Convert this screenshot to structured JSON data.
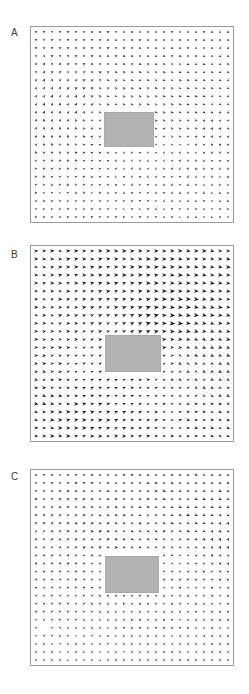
{
  "figure": {
    "width": 249,
    "height": 694,
    "background": "#ffffff",
    "arrow_color": "#101010",
    "obstacle_color": "#b2b2b2",
    "border_color": "#9a9a9a",
    "label_color": "#3a3a3a"
  },
  "panels": [
    {
      "label": "A",
      "label_x": 11,
      "label_y": 28,
      "frame": {
        "x": 30,
        "y": 26,
        "w": 204,
        "h": 197
      },
      "obstacle": {
        "x": 103,
        "y": 111,
        "w": 50,
        "h": 35
      },
      "grid": {
        "cols": 25,
        "rows": 24,
        "pad": 5
      },
      "field": {
        "type": "vortex",
        "centers": [
          {
            "cx": 0.3,
            "cy": 0.45,
            "strength": 1.0,
            "sense": 1
          },
          {
            "cx": 0.78,
            "cy": 0.58,
            "strength": 0.72,
            "sense": 1
          }
        ],
        "uniform": {
          "u": 0.04,
          "v": -0.02
        },
        "scale": 6.2,
        "seed": 17
      }
    },
    {
      "label": "B",
      "label_x": 11,
      "label_y": 250,
      "frame": {
        "x": 30,
        "y": 245,
        "w": 204,
        "h": 197
      },
      "obstacle": {
        "x": 104,
        "y": 334,
        "w": 56,
        "h": 37
      },
      "grid": {
        "cols": 25,
        "rows": 24,
        "pad": 5
      },
      "field": {
        "type": "vortex",
        "centers": [
          {
            "cx": 0.68,
            "cy": 0.5,
            "strength": 1.05,
            "sense": 1
          },
          {
            "cx": 0.22,
            "cy": 0.74,
            "strength": 0.55,
            "sense": -1
          }
        ],
        "uniform": {
          "u": 0.3,
          "v": 0.02
        },
        "scale": 6.4,
        "seed": 41
      }
    },
    {
      "label": "C",
      "label_x": 11,
      "label_y": 472,
      "frame": {
        "x": 30,
        "y": 469,
        "w": 204,
        "h": 197
      },
      "obstacle": {
        "x": 104,
        "y": 555,
        "w": 54,
        "h": 37
      },
      "grid": {
        "cols": 25,
        "rows": 24,
        "pad": 5
      },
      "field": {
        "type": "vortex",
        "centers": [
          {
            "cx": 0.34,
            "cy": 0.52,
            "strength": 1.0,
            "sense": 1
          },
          {
            "cx": 0.8,
            "cy": 0.38,
            "strength": 0.68,
            "sense": 1
          }
        ],
        "uniform": {
          "u": 0.08,
          "v": 0.03
        },
        "scale": 6.2,
        "seed": 93
      }
    }
  ],
  "chart_data": {
    "type": "quiver",
    "title": "",
    "xlabel": "",
    "ylabel": "",
    "grid": false,
    "legend": null,
    "panel_count": 3,
    "panel_labels": [
      "A",
      "B",
      "C"
    ],
    "arrow_glyph": "solid filled wedge",
    "annotations": [
      {
        "panel": "A",
        "text": "A"
      },
      {
        "panel": "B",
        "text": "B"
      },
      {
        "panel": "C",
        "text": "C"
      }
    ]
  }
}
